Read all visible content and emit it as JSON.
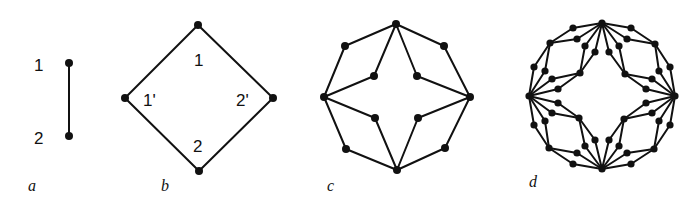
{
  "figure": {
    "background": "#ffffff",
    "ink": "#111111",
    "panels": [
      {
        "id": "a",
        "label": "a",
        "label_pos": [
          28,
          191
        ],
        "nodes": [
          [
            69,
            63
          ],
          [
            69,
            136
          ]
        ],
        "edges": [
          [
            0,
            1
          ]
        ],
        "vertex_labels": [
          {
            "text": "1",
            "pos": [
              34,
              71
            ]
          },
          {
            "text": "2",
            "pos": [
              34,
              144
            ]
          }
        ]
      },
      {
        "id": "b",
        "label": "b",
        "label_pos": [
          161,
          191
        ],
        "nodes": [
          [
            198,
            25
          ],
          [
            273,
            98
          ],
          [
            199,
            171
          ],
          [
            125,
            98
          ]
        ],
        "edges": [
          [
            0,
            1
          ],
          [
            1,
            2
          ],
          [
            2,
            3
          ],
          [
            3,
            0
          ]
        ],
        "vertex_labels": [
          {
            "text": "1",
            "pos": [
              194,
              66
            ]
          },
          {
            "text": "1'",
            "pos": [
              143,
              106
            ]
          },
          {
            "text": "2'",
            "pos": [
              236,
              106
            ]
          },
          {
            "text": "2",
            "pos": [
              193,
              152
            ]
          }
        ]
      },
      {
        "id": "c",
        "label": "c",
        "label_pos": [
          327,
          191
        ],
        "nodes": [
          [
            396,
            24
          ],
          [
            470,
            97
          ],
          [
            397,
            170
          ],
          [
            324,
            97
          ],
          [
            444,
            46
          ],
          [
            445,
            148
          ],
          [
            346,
            149
          ],
          [
            345,
            46
          ],
          [
            417,
            76
          ],
          [
            418,
            118
          ],
          [
            375,
            118
          ],
          [
            374,
            76
          ]
        ],
        "edges": [
          [
            0,
            4
          ],
          [
            4,
            1
          ],
          [
            1,
            5
          ],
          [
            5,
            2
          ],
          [
            2,
            6
          ],
          [
            6,
            3
          ],
          [
            3,
            7
          ],
          [
            7,
            0
          ],
          [
            0,
            8
          ],
          [
            8,
            1
          ],
          [
            1,
            9
          ],
          [
            9,
            2
          ],
          [
            2,
            10
          ],
          [
            10,
            3
          ],
          [
            3,
            11
          ],
          [
            11,
            0
          ]
        ]
      },
      {
        "id": "d",
        "label": "d",
        "label_pos": [
          529,
          187
        ],
        "center": [
          602,
          96
        ],
        "quadrant_template": {
          "hub_start": [
            0,
            -73
          ],
          "hub_end": [
            73,
            0
          ],
          "outer_branch": {
            "start_pair": [
              [
                29,
                -68
              ],
              [
                25,
                -57
              ]
            ],
            "mid": [
              53,
              -52
            ],
            "end_pair": [
              [
                68,
                -29
              ],
              [
                57,
                -25
              ]
            ]
          },
          "inner_branch": {
            "start_pair": [
              [
                17,
                -50
              ],
              [
                7,
                -44
              ]
            ],
            "mid": [
              23,
              -22
            ],
            "end_pair": [
              [
                50,
                -17
              ],
              [
                44,
                -7
              ]
            ]
          }
        },
        "quadrants": 4
      }
    ]
  }
}
